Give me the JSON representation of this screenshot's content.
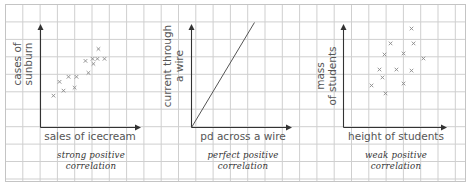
{
  "chart_data": [
    {
      "type": "scatter",
      "title": "strong positive correlation",
      "caption_lines": [
        "strong positive",
        "correlation"
      ],
      "xlabel": "sales of icecream",
      "ylabel_lines": [
        "cases of",
        "sunburn"
      ],
      "xlim": [
        0,
        6
      ],
      "ylim": [
        0,
        6
      ],
      "x_unit": "grid squares",
      "y_unit": "grid squares",
      "grid": true,
      "marker": "x",
      "points": [
        [
          0.75,
          1.84
        ],
        [
          1.1,
          2.64
        ],
        [
          1.33,
          2.13
        ],
        [
          1.62,
          2.93
        ],
        [
          2.08,
          2.93
        ],
        [
          1.97,
          2.3
        ],
        [
          2.77,
          3.16
        ],
        [
          2.6,
          3.85
        ],
        [
          3.06,
          3.68
        ],
        [
          3.01,
          3.97
        ],
        [
          3.29,
          3.97
        ],
        [
          3.35,
          4.54
        ],
        [
          3.7,
          3.97
        ]
      ]
    },
    {
      "type": "line",
      "title": "perfect positive correlation",
      "caption_lines": [
        "perfect positive",
        "correlation"
      ],
      "xlabel": "pd across a wire",
      "ylabel_lines": [
        "current through",
        "a wire"
      ],
      "xlim": [
        0,
        6
      ],
      "ylim": [
        0,
        6
      ],
      "x_unit": "grid squares",
      "y_unit": "grid squares",
      "grid": true,
      "line": [
        [
          0,
          0
        ],
        [
          3.64,
          6.07
        ]
      ]
    },
    {
      "type": "scatter",
      "title": "weak positive correlation",
      "caption_lines": [
        "weak positive",
        "correlation"
      ],
      "xlabel": "height of students",
      "ylabel_lines": [
        "mass",
        "of students"
      ],
      "xlim": [
        0,
        6
      ],
      "ylim": [
        0,
        6
      ],
      "x_unit": "grid squares",
      "y_unit": "grid squares",
      "grid": true,
      "marker": "x",
      "points": [
        [
          3.93,
          5.72
        ],
        [
          4.05,
          4.86
        ],
        [
          2.72,
          4.86
        ],
        [
          2.37,
          4.22
        ],
        [
          3.47,
          4.28
        ],
        [
          4.62,
          3.99
        ],
        [
          2.08,
          3.35
        ],
        [
          3.06,
          3.35
        ],
        [
          3.93,
          3.29
        ],
        [
          2.25,
          2.89
        ],
        [
          1.62,
          2.43
        ],
        [
          3.47,
          2.54
        ],
        [
          2.43,
          1.97
        ]
      ]
    }
  ],
  "colors": {
    "grid": "#cfcfcf",
    "axis": "#333333",
    "marker": "#8a8a8a",
    "label": "#555555",
    "caption": "#333333"
  }
}
